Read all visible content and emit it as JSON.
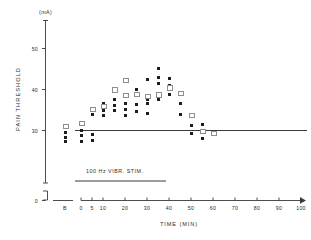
{
  "chart_data": {
    "type": "scatter",
    "title": "",
    "xlabel": "TIME (MIN)",
    "ylabel": "PAIN THRESHOLD",
    "yunit": "(mA)",
    "xlim": [
      -1,
      108
    ],
    "ylim": [
      0,
      55
    ],
    "grid": false,
    "legend_position": "none",
    "y_ticks": [
      "50",
      "40",
      "30",
      "0"
    ],
    "y_tick_values": [
      50,
      40,
      30,
      0
    ],
    "y_axis_break": true,
    "x_ticks": [
      "B",
      "0",
      "5",
      "10",
      "20",
      "30",
      "40",
      "50",
      "60",
      "70",
      "80",
      "90",
      "100"
    ],
    "x_tick_values": [
      -8,
      0,
      5,
      10,
      20,
      30,
      40,
      50,
      60,
      70,
      80,
      90,
      100
    ],
    "baseline_reference": {
      "label": "baseline-30",
      "y_value": 30,
      "spans_plot_width": true
    },
    "annotation_bar": {
      "text": "100 Hz VIBR. STIM.",
      "x_start": 0,
      "x_end": 40
    },
    "series": [
      {
        "name": "filled-square",
        "marker": "filled square",
        "points": [
          {
            "x": -8,
            "y": 29.4
          },
          {
            "x": -8,
            "y": 28.4
          },
          {
            "x": -8,
            "y": 27.4
          },
          {
            "x": 0,
            "y": 30.0
          },
          {
            "x": 0,
            "y": 28.8
          },
          {
            "x": 0,
            "y": 27.2
          },
          {
            "x": 5,
            "y": 35.1
          },
          {
            "x": 5,
            "y": 33.8
          },
          {
            "x": 5,
            "y": 29.0
          },
          {
            "x": 5,
            "y": 27.6
          },
          {
            "x": 10,
            "y": 36.6
          },
          {
            "x": 10,
            "y": 35.0
          },
          {
            "x": 10,
            "y": 33.6
          },
          {
            "x": 15,
            "y": 37.6
          },
          {
            "x": 15,
            "y": 36.2
          },
          {
            "x": 15,
            "y": 35.0
          },
          {
            "x": 20,
            "y": 36.5
          },
          {
            "x": 20,
            "y": 35.2
          },
          {
            "x": 20,
            "y": 33.6
          },
          {
            "x": 25,
            "y": 40.0
          },
          {
            "x": 25,
            "y": 38.8
          },
          {
            "x": 25,
            "y": 36.3
          },
          {
            "x": 25,
            "y": 34.6
          },
          {
            "x": 30,
            "y": 42.5
          },
          {
            "x": 30,
            "y": 37.6
          },
          {
            "x": 30,
            "y": 36.7
          },
          {
            "x": 30,
            "y": 34.2
          },
          {
            "x": 35,
            "y": 45.2
          },
          {
            "x": 35,
            "y": 43.0
          },
          {
            "x": 35,
            "y": 41.4
          },
          {
            "x": 35,
            "y": 37.6
          },
          {
            "x": 40,
            "y": 42.8
          },
          {
            "x": 40,
            "y": 41.0
          },
          {
            "x": 40,
            "y": 38.8
          },
          {
            "x": 45,
            "y": 36.5
          },
          {
            "x": 45,
            "y": 34.0
          },
          {
            "x": 45,
            "y": 33.8
          },
          {
            "x": 50,
            "y": 31.3
          },
          {
            "x": 50,
            "y": 29.2
          },
          {
            "x": 55,
            "y": 31.4
          },
          {
            "x": 55,
            "y": 28.0
          }
        ]
      },
      {
        "name": "open-square",
        "marker": "open square",
        "points": [
          {
            "x": -8,
            "y": 31.3
          },
          {
            "x": 0,
            "y": 31.9
          },
          {
            "x": 5,
            "y": 35.4
          },
          {
            "x": 10,
            "y": 36.0
          },
          {
            "x": 15,
            "y": 40.1
          },
          {
            "x": 20,
            "y": 42.5
          },
          {
            "x": 20,
            "y": 38.8
          },
          {
            "x": 25,
            "y": 39.0
          },
          {
            "x": 30,
            "y": 38.6
          },
          {
            "x": 35,
            "y": 38.9
          },
          {
            "x": 40,
            "y": 40.6
          },
          {
            "x": 45,
            "y": 39.2
          },
          {
            "x": 50,
            "y": 34.0
          },
          {
            "x": 55,
            "y": 29.9
          },
          {
            "x": 60,
            "y": 29.6
          }
        ]
      }
    ]
  },
  "axis": {
    "y_unit": "(mA)",
    "y_title": "PAIN THRESHOLD",
    "x_title": "TIME (MIN)"
  },
  "annotation": {
    "stim_text": "100 Hz VIBR. STIM."
  },
  "colors": {
    "axis": "#3a3a3a",
    "filled_marker": "#1d1d1d",
    "open_marker": "#8e8e8e",
    "reference_line": "#3a3a3a",
    "text": "#2b2b2b",
    "background": "#ffffff"
  }
}
